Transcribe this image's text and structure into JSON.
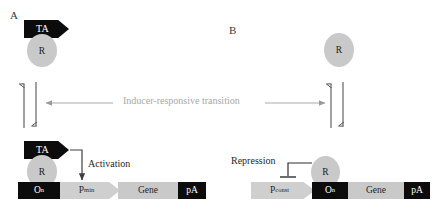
{
  "figure": {
    "panels": [
      {
        "letter": "A",
        "top_complex": {
          "activator_label": "TA",
          "repressor_label": "R"
        },
        "regulation_label": "Activation",
        "construct": [
          {
            "name": "operator",
            "label": "O",
            "subscript": "n",
            "style": "dark"
          },
          {
            "name": "promoter",
            "label": "P",
            "subscript": "min",
            "style": "promoter"
          },
          {
            "name": "gene",
            "label": "Gene",
            "subscript": "",
            "style": "light"
          },
          {
            "name": "polya",
            "label": "pA",
            "subscript": "",
            "style": "dark"
          }
        ],
        "bottom_complex": {
          "activator_label": "TA",
          "repressor_label": "R"
        }
      },
      {
        "letter": "B",
        "top_complex": {
          "repressor_label": "R"
        },
        "regulation_label": "Repression",
        "construct": [
          {
            "name": "promoter",
            "label": "P",
            "subscript": "const",
            "style": "promoter"
          },
          {
            "name": "operator",
            "label": "O",
            "subscript": "n",
            "style": "dark"
          },
          {
            "name": "gene",
            "label": "Gene",
            "subscript": "",
            "style": "light"
          },
          {
            "name": "polya",
            "label": "pA",
            "subscript": "",
            "style": "dark"
          }
        ],
        "bottom_complex": {
          "repressor_label": "R"
        }
      }
    ],
    "transition": {
      "label": "Inducer-responsive transition",
      "left_arrow_direction": "left",
      "right_arrow_direction": "right"
    },
    "colors": {
      "dark_block": "#0c0c0c",
      "light_block": "#c9c9c9",
      "promoter_block": "#cfcfcf",
      "repressor_fill": "#c9c9c9",
      "transition_text": "#a8a8a8",
      "line": "#555555"
    }
  }
}
